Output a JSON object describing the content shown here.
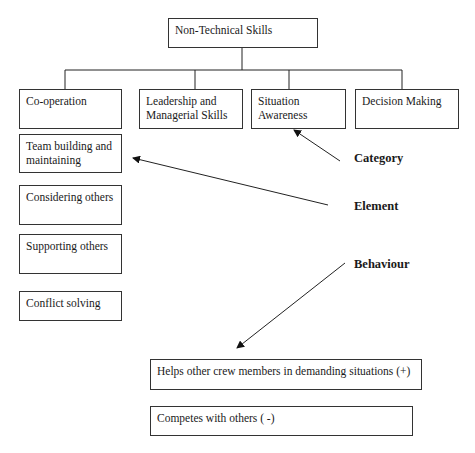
{
  "diagram": {
    "root": "Non-Technical Skills",
    "categories": [
      "Co-operation",
      "Leadership and Managerial Skills",
      "Situation Awareness",
      "Decision Making"
    ],
    "elements": [
      "Team building and maintaining",
      "Considering others",
      "Supporting others",
      "Conflict solving"
    ],
    "behaviours": [
      "Helps other crew members in demanding situations (+)",
      "Competes with others ( -)"
    ],
    "legend": {
      "category": "Category",
      "element": "Element",
      "behaviour": "Behaviour"
    }
  }
}
